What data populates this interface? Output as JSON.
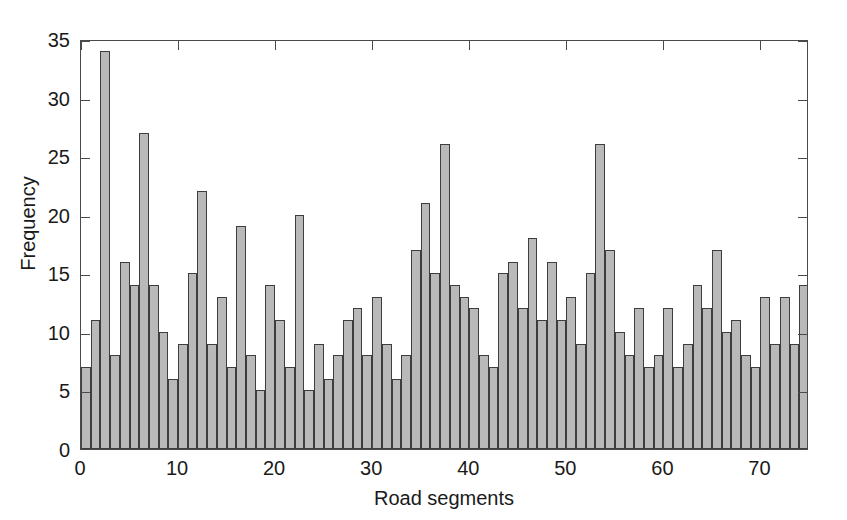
{
  "chart_data": {
    "type": "bar",
    "title": "",
    "subtitle": "",
    "xlabel": "Road segments",
    "ylabel": "Frequency",
    "xlim": [
      0,
      75
    ],
    "ylim": [
      0,
      35
    ],
    "xticks": [
      0,
      10,
      20,
      30,
      40,
      50,
      60,
      70
    ],
    "yticks": [
      0,
      5,
      10,
      15,
      20,
      25,
      30,
      35
    ],
    "grid": false,
    "legend": null,
    "bar_fill_color": "#b9b9b9",
    "bar_edge_color": "#3d3d3d",
    "axis_color": "#4a4a4a",
    "background_color": "#ffffff",
    "categories": [
      1,
      2,
      3,
      4,
      5,
      6,
      7,
      8,
      9,
      10,
      11,
      12,
      13,
      14,
      15,
      16,
      17,
      18,
      19,
      20,
      21,
      22,
      23,
      24,
      25,
      26,
      27,
      28,
      29,
      30,
      31,
      32,
      33,
      34,
      35,
      36,
      37,
      38,
      39,
      40,
      41,
      42,
      43,
      44,
      45,
      46,
      47,
      48,
      49,
      50,
      51,
      52,
      53,
      54,
      55,
      56,
      57,
      58,
      59,
      60,
      61,
      62,
      63,
      64,
      65,
      66,
      67,
      68,
      69,
      70,
      71,
      72,
      73,
      74,
      75
    ],
    "values": [
      7,
      11,
      34,
      8,
      16,
      14,
      27,
      14,
      10,
      6,
      9,
      15,
      22,
      9,
      13,
      7,
      19,
      8,
      5,
      14,
      11,
      7,
      20,
      5,
      9,
      6,
      8,
      11,
      12,
      8,
      13,
      9,
      6,
      8,
      17,
      21,
      15,
      26,
      14,
      13,
      12,
      8,
      7,
      15,
      16,
      12,
      18,
      11,
      16,
      11,
      13,
      9,
      15,
      26,
      17,
      10,
      8,
      12,
      7,
      8,
      12,
      7,
      9,
      14,
      12,
      17,
      10,
      11,
      8,
      7,
      13,
      9,
      13,
      9,
      14
    ]
  },
  "axes": {
    "ylabel": "Frequency",
    "xlabel": "Road segments",
    "ytick_labels": [
      "0",
      "5",
      "10",
      "15",
      "20",
      "25",
      "30",
      "35"
    ],
    "xtick_labels": [
      "0",
      "10",
      "20",
      "30",
      "40",
      "50",
      "60",
      "70"
    ]
  }
}
